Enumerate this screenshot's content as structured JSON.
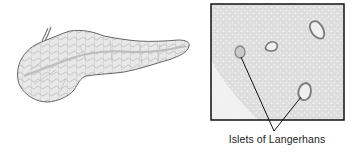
{
  "figure": {
    "left_panel": {
      "subject": "pancreas-illustration"
    },
    "right_panel": {
      "subject": "micrograph-pancreatic-tissue",
      "islets_marked": 2,
      "islets_visible": 4
    },
    "callout": {
      "label": "Islets of Langerhans"
    }
  },
  "colors": {
    "outline": "#555555",
    "fill": "#e6e6e6",
    "tissue": "#dcdcdc",
    "border": "#111111",
    "pointer": "#111111"
  }
}
